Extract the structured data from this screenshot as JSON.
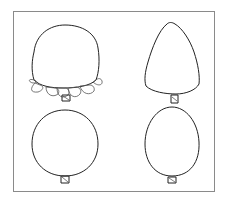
{
  "diagram": {
    "type": "tree-crown-shapes",
    "frame": {
      "stroke": "#8a8a8a"
    },
    "line_color": "#222222",
    "shapes": [
      {
        "id": "rounded-crown-with-leaves",
        "position": "top-left",
        "shape": "rounded-square crown with leaf skirt"
      },
      {
        "id": "conical-crown",
        "position": "top-right",
        "shape": "cone / triangle crown"
      },
      {
        "id": "round-crown",
        "position": "bottom-left",
        "shape": "circle crown"
      },
      {
        "id": "oval-crown",
        "position": "bottom-right",
        "shape": "egg / oval crown"
      }
    ]
  }
}
